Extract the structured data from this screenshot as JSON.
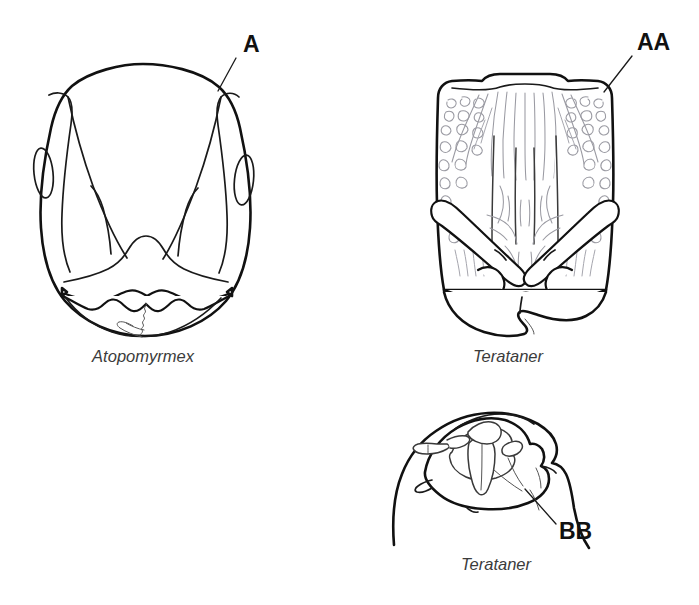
{
  "plate": {
    "width": 699,
    "height": 605,
    "background_color": "#ffffff",
    "ink_color": "#111111",
    "sculpture_color": "#9a9aa2",
    "type": "scientific-line-drawing",
    "subject": "ant head morphology comparison"
  },
  "figures": [
    {
      "id": "fig-atopomyrmex-head",
      "view": "full-face head",
      "taxon_label": "Atopomyrmex",
      "taxon_label_x": 143,
      "taxon_label_y": 362,
      "callouts": [
        {
          "id": "callout-a",
          "text": "A",
          "text_x": 243,
          "text_y": 52,
          "leader_from_x": 236,
          "leader_from_y": 58,
          "leader_to_x": 218,
          "leader_to_y": 91
        }
      ]
    },
    {
      "id": "fig-terataner-head",
      "view": "full-face head",
      "taxon_label": "Terataner",
      "taxon_label_x": 508,
      "taxon_label_y": 362,
      "callouts": [
        {
          "id": "callout-aa",
          "text": "AA",
          "text_x": 637,
          "text_y": 50,
          "leader_from_x": 632,
          "leader_from_y": 56,
          "leader_to_x": 604,
          "leader_to_y": 92
        }
      ]
    },
    {
      "id": "fig-terataner-lateral",
      "view": "lateral head / mandible",
      "taxon_label": "Terataner",
      "taxon_label_x": 496,
      "taxon_label_y": 570,
      "callouts": [
        {
          "id": "callout-bb",
          "text": "BB",
          "text_x": 559,
          "text_y": 539,
          "leader_from_x": 556,
          "leader_from_y": 524,
          "leader_to_x": 525,
          "leader_to_y": 489
        }
      ]
    }
  ]
}
